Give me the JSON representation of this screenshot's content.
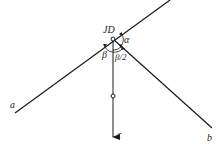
{
  "diagram": {
    "type": "geometry-angle-bisector",
    "colors": {
      "line": "#1a1a1a",
      "background": "#ffffff"
    },
    "point": {
      "label": "JD",
      "x": 113,
      "y": 39
    },
    "lines": [
      {
        "id": "a",
        "label": "a",
        "from": [
          15,
          113
        ],
        "to": [
          170,
          0
        ]
      },
      {
        "id": "b",
        "label": "b",
        "from": [
          113,
          39
        ],
        "to": [
          212,
          128
        ]
      },
      {
        "id": "c",
        "label": "c",
        "from": [
          113,
          39
        ],
        "to": [
          113,
          137
        ],
        "arrow": true
      }
    ],
    "angles": [
      {
        "label": "α"
      },
      {
        "label": "β"
      },
      {
        "label": "β/2"
      }
    ],
    "labels": {
      "jd": "JD",
      "alpha": "α",
      "beta": "β",
      "half_beta": "β/2",
      "a": "a",
      "b": "b",
      "c": "c"
    }
  }
}
